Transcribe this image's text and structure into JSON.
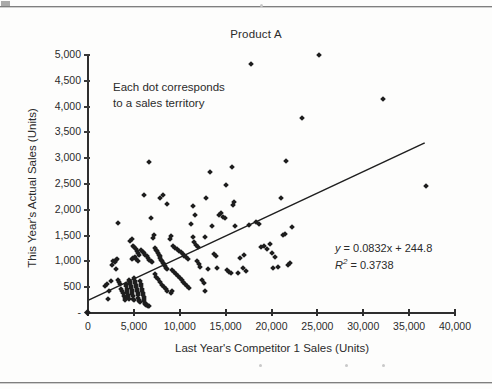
{
  "page": {
    "background_color": "#fdfdfc",
    "rule_color": "#7f7f7f"
  },
  "chart_data": {
    "type": "scatter",
    "title": "Product A",
    "xlabel": "Last Year's Competitor 1 Sales (Units)",
    "ylabel": "This Year's Actual Sales (Units)",
    "xlim": [
      0,
      40000
    ],
    "ylim": [
      0,
      5000
    ],
    "xticks": [
      0,
      5000,
      10000,
      15000,
      20000,
      25000,
      30000,
      35000,
      40000
    ],
    "xtick_labels": [
      "0",
      "5,000",
      "10,000",
      "15,000",
      "20,000",
      "25,000",
      "30,000",
      "35,000",
      "40,000"
    ],
    "yticks": [
      0,
      500,
      1000,
      1500,
      2000,
      2500,
      3000,
      3500,
      4000,
      4500,
      5000
    ],
    "ytick_labels": [
      "-",
      "500",
      "1,000",
      "1,500",
      "2,000",
      "2,500",
      "3,000",
      "3,500",
      "4,000",
      "4,500",
      "5,000"
    ],
    "grid": false,
    "legend": null,
    "marker": "diamond",
    "marker_color": "#1d1d1d",
    "annotations": [
      {
        "text": "Each dot corresponds\nto a sales territory",
        "x": 2700,
        "y": 4450
      },
      {
        "text": "y = 0.0832x + 244.8",
        "x": 26500,
        "y": 1330
      },
      {
        "text": "R² = 0.3738",
        "x": 26500,
        "y": 1130
      }
    ],
    "trendline": {
      "type": "linear",
      "equation": "y = 0.0832x + 244.8",
      "slope": 0.0832,
      "intercept": 244.8,
      "r_squared": 0.3738,
      "x_start": 0,
      "x_end": 36700,
      "y_start": 245,
      "y_end": 3298
    },
    "points": [
      [
        1900,
        520
      ],
      [
        2100,
        560
      ],
      [
        2300,
        430
      ],
      [
        2200,
        270
      ],
      [
        2600,
        930
      ],
      [
        2500,
        620
      ],
      [
        2700,
        1010
      ],
      [
        2900,
        990
      ],
      [
        3000,
        1030
      ],
      [
        3100,
        860
      ],
      [
        3200,
        1040
      ],
      [
        3300,
        640
      ],
      [
        3400,
        600
      ],
      [
        3500,
        560
      ],
      [
        3600,
        470
      ],
      [
        3700,
        420
      ],
      [
        3800,
        380
      ],
      [
        3900,
        330
      ],
      [
        4000,
        300
      ],
      [
        4050,
        250
      ],
      [
        4100,
        560
      ],
      [
        4150,
        520
      ],
      [
        4200,
        470
      ],
      [
        4250,
        430
      ],
      [
        4300,
        390
      ],
      [
        4350,
        350
      ],
      [
        4400,
        310
      ],
      [
        4450,
        280
      ],
      [
        4500,
        640
      ],
      [
        4550,
        600
      ],
      [
        4600,
        560
      ],
      [
        4650,
        520
      ],
      [
        4700,
        480
      ],
      [
        4750,
        440
      ],
      [
        4800,
        400
      ],
      [
        4850,
        360
      ],
      [
        4900,
        320
      ],
      [
        4950,
        280
      ],
      [
        5000,
        250
      ],
      [
        5050,
        680
      ],
      [
        5100,
        620
      ],
      [
        5150,
        580
      ],
      [
        5200,
        540
      ],
      [
        5250,
        500
      ],
      [
        5300,
        460
      ],
      [
        5350,
        420
      ],
      [
        5400,
        380
      ],
      [
        5450,
        340
      ],
      [
        5500,
        300
      ],
      [
        5550,
        260
      ],
      [
        5600,
        230
      ],
      [
        5650,
        210
      ],
      [
        5700,
        620
      ],
      [
        5750,
        560
      ],
      [
        5800,
        520
      ],
      [
        5850,
        470
      ],
      [
        5900,
        430
      ],
      [
        5950,
        390
      ],
      [
        6000,
        350
      ],
      [
        6050,
        310
      ],
      [
        6100,
        270
      ],
      [
        6150,
        240
      ],
      [
        6200,
        200
      ],
      [
        6250,
        180
      ],
      [
        6300,
        160
      ],
      [
        6400,
        150
      ],
      [
        6500,
        140
      ],
      [
        6600,
        130
      ],
      [
        4850,
        1040
      ],
      [
        4950,
        1070
      ],
      [
        5100,
        1090
      ],
      [
        5250,
        1050
      ],
      [
        5400,
        1010
      ],
      [
        3300,
        1750
      ],
      [
        4600,
        1390
      ],
      [
        4750,
        1430
      ],
      [
        4900,
        1300
      ],
      [
        5050,
        1270
      ],
      [
        5200,
        1240
      ],
      [
        5350,
        1200
      ],
      [
        5500,
        1160
      ],
      [
        5600,
        1120
      ],
      [
        5800,
        1230
      ],
      [
        5950,
        1180
      ],
      [
        6100,
        1160
      ],
      [
        6250,
        1130
      ],
      [
        6400,
        1100
      ],
      [
        6550,
        1060
      ],
      [
        6700,
        1030
      ],
      [
        6850,
        1000
      ],
      [
        7000,
        980
      ],
      [
        6100,
        2280
      ],
      [
        6650,
        2930
      ],
      [
        6900,
        1840
      ],
      [
        7100,
        1460
      ],
      [
        7200,
        1520
      ],
      [
        7300,
        1260
      ],
      [
        7400,
        1230
      ],
      [
        7500,
        1200
      ],
      [
        7600,
        1170
      ],
      [
        7700,
        1130
      ],
      [
        7800,
        1100
      ],
      [
        7900,
        1070
      ],
      [
        8000,
        1030
      ],
      [
        8100,
        1000
      ],
      [
        8200,
        970
      ],
      [
        8300,
        940
      ],
      [
        8400,
        910
      ],
      [
        8500,
        880
      ],
      [
        8600,
        850
      ],
      [
        7250,
        750
      ],
      [
        7450,
        700
      ],
      [
        7650,
        650
      ],
      [
        7850,
        600
      ],
      [
        8050,
        550
      ],
      [
        8250,
        500
      ],
      [
        8450,
        460
      ],
      [
        8650,
        430
      ],
      [
        7900,
        2220
      ],
      [
        8200,
        2290
      ],
      [
        8600,
        2110
      ],
      [
        8900,
        1440
      ],
      [
        9100,
        1490
      ],
      [
        9300,
        1300
      ],
      [
        9500,
        1260
      ],
      [
        9700,
        1240
      ],
      [
        9900,
        1210
      ],
      [
        10100,
        1180
      ],
      [
        10300,
        1150
      ],
      [
        10500,
        1110
      ],
      [
        10700,
        1080
      ],
      [
        10900,
        1050
      ],
      [
        9200,
        840
      ],
      [
        9400,
        800
      ],
      [
        9600,
        760
      ],
      [
        9800,
        720
      ],
      [
        10000,
        680
      ],
      [
        10200,
        640
      ],
      [
        10400,
        600
      ],
      [
        10600,
        560
      ],
      [
        10800,
        520
      ],
      [
        11000,
        480
      ],
      [
        9000,
        380
      ],
      [
        9200,
        430
      ],
      [
        11200,
        1720
      ],
      [
        11400,
        1480
      ],
      [
        11600,
        1380
      ],
      [
        11800,
        1320
      ],
      [
        12000,
        1280
      ],
      [
        12100,
        950
      ],
      [
        12200,
        900
      ],
      [
        12400,
        640
      ],
      [
        12600,
        580
      ],
      [
        12700,
        430
      ],
      [
        11400,
        2070
      ],
      [
        11700,
        1900
      ],
      [
        12900,
        2220
      ],
      [
        13300,
        2740
      ],
      [
        13500,
        1680
      ],
      [
        13700,
        1150
      ],
      [
        13900,
        1110
      ],
      [
        14100,
        880
      ],
      [
        14300,
        1900
      ],
      [
        14500,
        1930
      ],
      [
        14700,
        1870
      ],
      [
        14900,
        1840
      ],
      [
        15000,
        2480
      ],
      [
        15200,
        830
      ],
      [
        15400,
        790
      ],
      [
        15600,
        780
      ],
      [
        15700,
        2830
      ],
      [
        15800,
        2100
      ],
      [
        15900,
        2160
      ],
      [
        16000,
        1680
      ],
      [
        16300,
        770
      ],
      [
        17500,
        1700
      ],
      [
        17800,
        4830
      ],
      [
        18300,
        1760
      ],
      [
        18600,
        1730
      ],
      [
        18900,
        1280
      ],
      [
        19200,
        1300
      ],
      [
        19500,
        1250
      ],
      [
        19800,
        1340
      ],
      [
        20100,
        1160
      ],
      [
        20400,
        1080
      ],
      [
        20700,
        890
      ],
      [
        21000,
        2230
      ],
      [
        21200,
        1520
      ],
      [
        21500,
        1530
      ],
      [
        21800,
        930
      ],
      [
        22000,
        960
      ],
      [
        22200,
        1660
      ],
      [
        20200,
        870
      ],
      [
        23300,
        3770
      ],
      [
        25200,
        5000
      ],
      [
        21600,
        2940
      ],
      [
        32100,
        4140
      ],
      [
        36800,
        2470
      ],
      [
        16600,
        1060
      ],
      [
        17000,
        1120
      ],
      [
        16900,
        880
      ],
      [
        17200,
        820
      ],
      [
        13100,
        860
      ],
      [
        12800,
        1480
      ],
      [
        11900,
        1010
      ]
    ]
  }
}
